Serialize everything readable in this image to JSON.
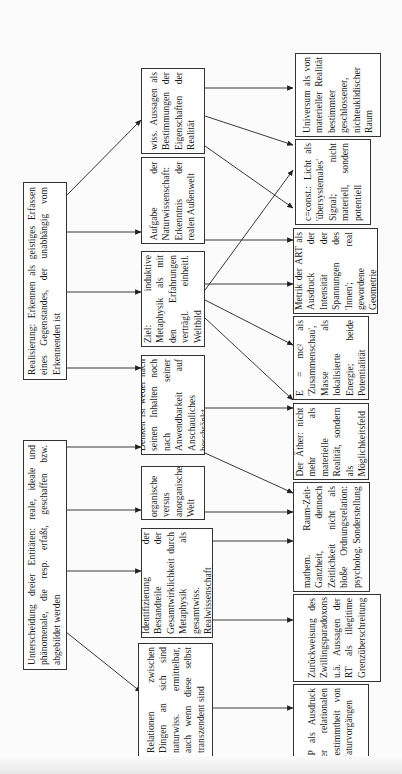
{
  "diagram": {
    "roots": [
      {
        "id": "realisierung",
        "text": "Realisierung: Erkennen als geistiges Erfassen eines Gegenstandes, der unabhängig vom Erkennenden ist"
      },
      {
        "id": "unterscheidung",
        "text": "Unterscheidung dreier Entitäten: reale, ideale und phänomenale, die resp. erfaßt, geschaffen bzw. abgebildet werden"
      }
    ],
    "middle": [
      {
        "id": "wiss-aussagen",
        "text": "wiss. Aussagen als Bestimmungen der Eigenschaften der Realität"
      },
      {
        "id": "aufgabe",
        "text": "Aufgabe der Naturwissenschaft: Erkenntnis der realen Außenwelt"
      },
      {
        "id": "ziel",
        "text": "Ziel: induktive Metaphysik als mit den Erfahrungen verträgl. einheitl. Weltbild"
      },
      {
        "id": "denken",
        "text": "Denken ist weder nach seinen Inhalten noch nach seiner Anwendbarkeit auf Anschauliches beschränkt"
      },
      {
        "id": "organische",
        "text": "organische versus anorganische Welt"
      },
      {
        "id": "identifizierung",
        "text": "Identifizierung der Bestandteile der Gesamtwirklichkeit durch Metaphysik als gesamtwiss. Realwissenschaft"
      },
      {
        "id": "relationen",
        "text": "Relationen zwischen Dingen an sich sind naturwiss. ermittelbar, auch wenn diese selbst transzendent sind"
      }
    ],
    "right": [
      {
        "id": "universum",
        "text": "Universum als von materieller Realität bestimmter geschlossener, nichteuklidischer Raum"
      },
      {
        "id": "c-const",
        "text": "c=const.: Licht als 'übersystemales' Signal; nicht materiell, sondern potentiell"
      },
      {
        "id": "metrik",
        "text": "Metrik der ART als Ausdruck der Intensität der Spannungen des 'Innen'; real gewordene Geometrie"
      },
      {
        "id": "emc2",
        "text": "E = mc² als 'Zusammenschau', Masse als lokalisierte Energie; beide Potentialität"
      },
      {
        "id": "aether",
        "text": "Der Äther: nicht mehr als materielle Realität, sondern als Möglichkeitsfeld"
      },
      {
        "id": "mathem",
        "text": "mathem. Raum-Zeit-Ganzheit, dennoch Zeitlichkeit nicht als bloße Ordnungsrelation: psycholog. Sonderstellung"
      },
      {
        "id": "zurueckweisung",
        "text": "Zurückweisung des Zwillingsparadoxons u.ä. Aussagen der RT als illegitime Grenzüberschreitung"
      },
      {
        "id": "rp",
        "text": "RP als Ausdruck der relationalen Bestimmtheit von Naturvorgängen"
      }
    ]
  },
  "colors": {
    "line": "#222222",
    "box_border": "#333333",
    "paper": "#fbfbfb"
  }
}
